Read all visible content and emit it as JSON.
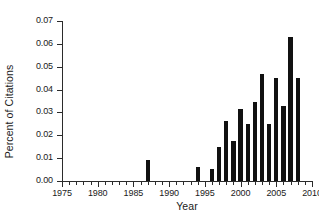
{
  "chart_data": {
    "type": "bar",
    "title": "",
    "xlabel": "Year",
    "ylabel": "Percent of Citations",
    "xlim": [
      1975,
      2010
    ],
    "ylim": [
      0.0,
      0.07
    ],
    "grid": false,
    "legend": null,
    "xtick_labels": [
      "1975",
      "1980",
      "1985",
      "1990",
      "1995",
      "2000",
      "2005",
      "2010"
    ],
    "xtick_values": [
      1975,
      1980,
      1985,
      1990,
      1995,
      2000,
      2005,
      2010
    ],
    "xtick_minor_step": 1,
    "ytick_labels": [
      "0.00",
      "0.01",
      "0.02",
      "0.03",
      "0.04",
      "0.05",
      "0.06",
      "0.07"
    ],
    "ytick_values": [
      0.0,
      0.01,
      0.02,
      0.03,
      0.04,
      0.05,
      0.06,
      0.07
    ],
    "bar_color": "#111111",
    "bar_width_years": 0.62,
    "categories": [
      1987,
      1994,
      1996,
      1997,
      1998,
      1999,
      2000,
      2001,
      2002,
      2003,
      2004,
      2005,
      2006,
      2007,
      2008
    ],
    "values": [
      0.009,
      0.006,
      0.0053,
      0.0147,
      0.0263,
      0.0173,
      0.0315,
      0.025,
      0.0344,
      0.0466,
      0.0251,
      0.0452,
      0.0328,
      0.063,
      0.0451
    ]
  },
  "axis_colors": {
    "axis_line": "#2b2b2b",
    "text": "#1a1a1a",
    "background": "#ffffff"
  }
}
